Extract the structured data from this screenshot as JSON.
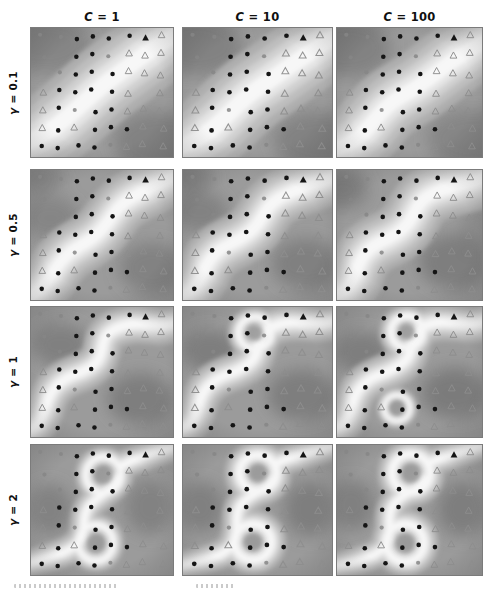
{
  "figure": {
    "col_headers": [
      "C = 1",
      "C = 10",
      "C = 100"
    ],
    "row_labels": [
      "γ = 0.1",
      "γ = 0.5",
      "γ = 1",
      "γ = 2"
    ]
  },
  "chart_data": {
    "type": "heatmap",
    "title": "",
    "col_param": {
      "symbol": "C",
      "values": [
        1,
        10,
        100
      ]
    },
    "row_param": {
      "symbol": "γ",
      "values": [
        0.1,
        0.5,
        1,
        2
      ]
    },
    "legend": {
      "black_dot": "class 1 training point",
      "gray_triangle": "class 2 training point (open)",
      "black_triangle": "class 2 point, dark",
      "gray_dot": "class 1 point, faint"
    },
    "marker_grid": [
      "ggbbbbTt",
      "g.bbgttt",
      ".gbbbttt",
      "tbbbbt.t",
      "tbgbbttt",
      "tbtbbbtt",
      "bbbbgttt"
    ],
    "panels": [
      {
        "id": "gamma-0.1_C-1",
        "row": 0,
        "col": 0,
        "bw": 80,
        "paths": [
          "M -16,120 C 30,106 52,72 84,50 C 112,30 132,14 160,0"
        ],
        "rings": [],
        "blobs": [
          [
            14,
            16,
            48,
            30,
            0.45
          ],
          [
            132,
            116,
            48,
            32,
            0.5
          ]
        ]
      },
      {
        "id": "gamma-0.1_C-10",
        "row": 0,
        "col": 1,
        "bw": 78,
        "paths": [
          "M -16,124 C 32,112 42,82 74,60 C 102,41 126,20 160,2"
        ],
        "rings": [],
        "blobs": [
          [
            12,
            18,
            46,
            30,
            0.5
          ],
          [
            134,
            114,
            46,
            30,
            0.5
          ]
        ]
      },
      {
        "id": "gamma-0.1_C-100",
        "row": 0,
        "col": 2,
        "bw": 72,
        "paths": [
          "M -16,126 C 36,116 30,88 66,68 C 98,50 102,40 130,24 C 144,16 152,10 160,6"
        ],
        "rings": [],
        "blobs": [
          [
            10,
            20,
            44,
            30,
            0.5
          ],
          [
            136,
            112,
            46,
            30,
            0.45
          ]
        ]
      },
      {
        "id": "gamma-0.5_C-1",
        "row": 1,
        "col": 0,
        "bw": 56,
        "paths": [
          "M -16,132 C 26,120 16,94 50,76 C 84,58 78,40 106,26 C 124,16 140,10 156,2"
        ],
        "rings": [],
        "blobs": [
          [
            20,
            48,
            30,
            22,
            0.45
          ],
          [
            124,
            98,
            34,
            26,
            0.5
          ],
          [
            8,
            8,
            26,
            16,
            0.35
          ]
        ]
      },
      {
        "id": "gamma-0.5_C-10",
        "row": 1,
        "col": 1,
        "bw": 54,
        "paths": [
          "M -16,130 C 30,122 8,92 46,74 C 86,55 70,38 102,24 C 122,14 138,12 156,4"
        ],
        "rings": [],
        "blobs": [
          [
            16,
            42,
            28,
            20,
            0.5
          ],
          [
            120,
            94,
            34,
            26,
            0.55
          ],
          [
            6,
            6,
            24,
            16,
            0.4
          ]
        ]
      },
      {
        "id": "gamma-0.5_C-100",
        "row": 1,
        "col": 2,
        "bw": 58,
        "paths": [
          "M -16,128 C 32,124 6,90 44,72 C 88,53 68,34 100,22 C 122,13 142,14 156,2"
        ],
        "rings": [],
        "blobs": [
          [
            6,
            20,
            26,
            20,
            0.5
          ],
          [
            118,
            92,
            36,
            28,
            0.6
          ],
          [
            140,
            58,
            16,
            24,
            0.35
          ]
        ]
      },
      {
        "id": "gamma-1_C-1",
        "row": 2,
        "col": 0,
        "bw": 40,
        "paths": [
          "M -16,126 C 28,124 0,84 44,68 C 92,52 56,30 94,19 C 118,12 128,24 152,14"
        ],
        "rings": [],
        "blobs": [
          [
            30,
            38,
            30,
            22,
            0.55
          ],
          [
            112,
            92,
            34,
            26,
            0.6
          ]
        ]
      },
      {
        "id": "gamma-1_C-10",
        "row": 2,
        "col": 1,
        "bw": 38,
        "paths": [
          "M -16,124 C 30,122 -2,86 42,68 C 92,51 58,30 92,18 C 116,10 130,22 152,12"
        ],
        "rings": [
          [
            70,
            26,
            16,
            0.7
          ]
        ],
        "blobs": [
          [
            26,
            44,
            28,
            22,
            0.6
          ],
          [
            116,
            88,
            34,
            26,
            0.6
          ]
        ]
      },
      {
        "id": "gamma-1_C-100",
        "row": 2,
        "col": 2,
        "bw": 38,
        "paths": [
          "M -16,124 C 30,122 -2,86 42,68 C 94,50 60,32 90,18 C 114,9 132,24 152,12"
        ],
        "rings": [
          [
            70,
            25,
            16,
            0.8
          ],
          [
            60,
            101,
            13,
            0.5
          ]
        ],
        "blobs": [
          [
            24,
            46,
            28,
            22,
            0.6
          ],
          [
            118,
            86,
            34,
            26,
            0.65
          ]
        ]
      },
      {
        "id": "gamma-2_C-1",
        "row": 3,
        "col": 0,
        "bw": 30,
        "paths": [
          "M -16,122 C 14,114 34,110 46,100 C 60,88 48,72 62,58 C 76,46 84,44 90,32",
          "M 94,20 C 112,10 134,6 158,-2"
        ],
        "rings": [
          [
            74,
            30,
            18,
            0.75
          ],
          [
            66,
            98,
            18,
            0.75
          ]
        ],
        "blobs": [
          [
            18,
            64,
            24,
            26,
            0.5
          ],
          [
            122,
            62,
            26,
            28,
            0.5
          ]
        ]
      },
      {
        "id": "gamma-2_C-10",
        "row": 3,
        "col": 1,
        "bw": 30,
        "paths": [
          "M -16,124 C 16,116 38,114 48,100 C 58,84 46,68 60,56 C 70,46 82,46 88,34",
          "M 92,18 C 112,8 136,6 158,-4"
        ],
        "rings": [
          [
            73,
            28,
            18,
            1
          ],
          [
            68,
            97,
            18,
            1
          ]
        ],
        "blobs": [
          [
            16,
            62,
            24,
            26,
            0.55
          ],
          [
            124,
            64,
            26,
            28,
            0.6
          ]
        ]
      },
      {
        "id": "gamma-2_C-100",
        "row": 3,
        "col": 2,
        "bw": 30,
        "paths": [
          "M -16,124 C 16,118 36,114 48,102 C 58,86 46,68 60,56 C 70,46 82,46 88,34",
          "M 92,18 C 114,8 136,4 158,-4"
        ],
        "rings": [
          [
            74,
            28,
            19,
            1
          ],
          [
            68,
            98,
            19,
            1
          ]
        ],
        "blobs": [
          [
            14,
            60,
            24,
            26,
            0.55
          ],
          [
            126,
            64,
            26,
            28,
            0.6
          ]
        ]
      }
    ]
  },
  "palette": {
    "panel_base": "#9b9b9b",
    "blob_dark": "#6a6a6a",
    "band_levels": [
      "#aeaeae",
      "#bebebe",
      "#d0d0d0",
      "#e4e4e4",
      "#f7f7f7"
    ],
    "marker_black": "#151515",
    "marker_gray": "#868686",
    "triangle_gray": "#8d8d8d",
    "header_color": "#101010"
  }
}
